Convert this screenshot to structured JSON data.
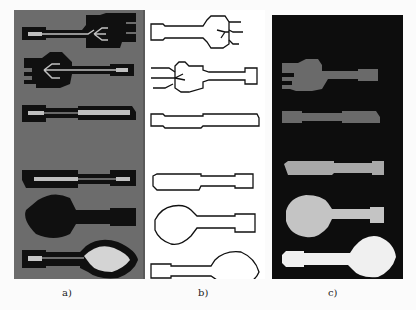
{
  "figure": {
    "panels": [
      {
        "id": "a",
        "label": "a)",
        "description": "Gray background, black cutlery silhouettes with light gray skeleton lines",
        "background": "#6c6c6c"
      },
      {
        "id": "b",
        "label": "b)",
        "description": "White background, black cutlery contour outlines",
        "background": "#ffffff"
      },
      {
        "id": "c",
        "label": "c)",
        "description": "Black background, filled cutlery regions in gray levels",
        "background": "#0d0d0d"
      }
    ],
    "objects": [
      "fork",
      "fork",
      "knife",
      "knife",
      "spoon",
      "spoon"
    ],
    "colors": {
      "silhouette": "#101010",
      "skeleton": "#c8c8c8",
      "contour": "#111111",
      "fill_dark_gray": "#6a6a6a",
      "fill_light_gray": "#c4c4c4",
      "fill_white": "#f0f0f0"
    }
  }
}
